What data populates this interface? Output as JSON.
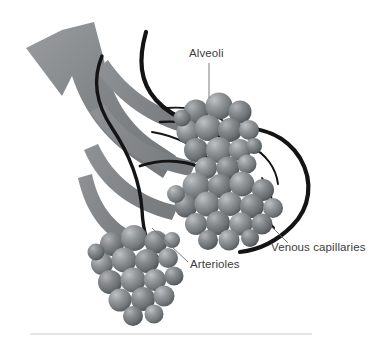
{
  "figure": {
    "title": "Alveoli and pulmonary capillaries diagram",
    "width": 372,
    "height": 342,
    "background_color": "#ffffff"
  },
  "labels": {
    "alveoli": "Alveoli",
    "arterioles": "Arterioles",
    "venous_capillaries": "Venous capillaries"
  },
  "colors": {
    "background": "#ffffff",
    "bronchus_gray": "#808080",
    "bronchus_gray_light": "#96999a",
    "bronchus_gray_dark": "#6e7274",
    "alveoli_sphere": "#8c9093",
    "alveoli_highlight": "#b9bcbe",
    "alveoli_shadow": "#5e6366",
    "vessel_dark": "#141414",
    "label_text": "#3b3b3b",
    "leader_line": "#6b6b6b",
    "baseline_rule": "#c9c9c9"
  },
  "structures": {
    "bronchus_arrow": "thick gray airway shaped like an arrow pointing up-left",
    "bronchiole_branches": "fan of gray branches radiating right toward alveolar clusters",
    "alveolar_cluster_upper": "grape-like cluster of gray spheres, upper right",
    "alveolar_cluster_lower": "grape-like cluster of gray spheres, lower left",
    "capillary_vessels": "dark winding vessels surrounding the alveolar clusters"
  },
  "leader_lines": {
    "alveoli": "vertical line from label down to upper alveolar cluster",
    "arterioles": "diagonal line from label up-left to arteriole branch",
    "venous_capillaries": "diagonal line from label up-left to dark vessel"
  },
  "baseline_rule": {
    "present": true,
    "description": "faint light gray horizontal rule near bottom of figure"
  }
}
